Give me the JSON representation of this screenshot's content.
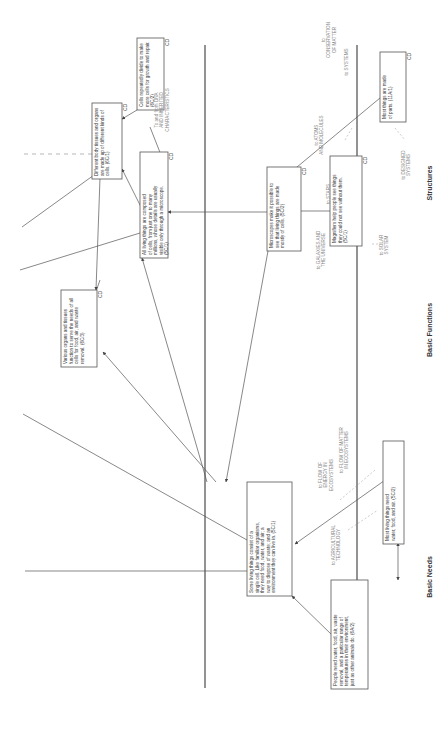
{
  "bands": [
    {
      "label": "Structures"
    },
    {
      "label": "Basic Functions"
    },
    {
      "label": "Basic Needs"
    }
  ],
  "nodes": [
    {
      "id": "n1",
      "code": "CD",
      "lines": [
        "Different body tissues and organs",
        "are made up of different kinds of",
        "cells. (6C/1)"
      ]
    },
    {
      "id": "n2",
      "code": "CD",
      "lines": [
        "Cells repeatedly divide to make",
        "more cells for growth and repair.",
        "(6C/2)"
      ]
    },
    {
      "id": "n3",
      "code": "CD",
      "lines": [
        "All living things are composed",
        "of cells, from just one to many",
        "millions, whose details are usually",
        "visible only through a microscope.",
        "(5C/1)"
      ]
    },
    {
      "id": "n4",
      "code": "CD",
      "lines": [
        "Microscopes make it possible to",
        "see that living things are made",
        "mostly of cells. (5C/2)"
      ]
    },
    {
      "id": "n5",
      "code": "CD",
      "lines": [
        "Magnifiers help people see things",
        "they could not see without them.",
        "(5C/1)"
      ]
    },
    {
      "id": "n6",
      "code": "CD",
      "lines": [
        "Most things are made",
        "of parts. (11A/1)"
      ]
    },
    {
      "id": "n7",
      "code": "CD",
      "lines": [
        "Various organs and tissues",
        "function to serve the needs of all",
        "cells for food, air, and waste",
        "removal. (6C/3)"
      ]
    },
    {
      "id": "n8",
      "code": "",
      "lines": [
        "Some living things consist of a",
        "single cell. Like familiar organisms,",
        "they need food, water, and air; a",
        "way to dispose of waste; and an",
        "environment they can live in. (5C/1)"
      ]
    },
    {
      "id": "n9",
      "code": "",
      "lines": [
        "Most living things need",
        "water, food, and air. (5C/2)"
      ]
    },
    {
      "id": "n10",
      "code": "",
      "lines": [
        "People need water, food, air, waste",
        "removal, and a particular range of",
        "temperatures in their environment,",
        "just as other animals do. (6A/2)"
      ]
    }
  ],
  "connections": [
    {
      "id": "c1",
      "lines": [
        "To and from DNA",
        "AND INHERITED",
        "CHARACTERISTICS"
      ]
    },
    {
      "id": "c2",
      "lines": [
        "to",
        "CONSERVATION",
        "OF MATTER"
      ]
    },
    {
      "id": "c3",
      "lines": [
        "to SYSTEMS"
      ]
    },
    {
      "id": "c4",
      "lines": [
        "to ATOMS",
        "AND MOLECULES"
      ]
    },
    {
      "id": "c5",
      "lines": [
        "to STARS"
      ]
    },
    {
      "id": "c6",
      "lines": [
        "to DESIGNED",
        "SYSTEMS"
      ]
    },
    {
      "id": "c7",
      "lines": [
        "to GALAXIES AND",
        "THE UNIVERSE"
      ]
    },
    {
      "id": "c8",
      "lines": [
        "to SOLAR",
        "SYSTEM"
      ]
    },
    {
      "id": "c9",
      "lines": [
        "to FLOW OF MATTER",
        "IN ECOSYSTEMS"
      ]
    },
    {
      "id": "c10",
      "lines": [
        "to FLOW OF",
        "ENERGY IN",
        "ECOSYSTEMS"
      ]
    },
    {
      "id": "c11",
      "lines": [
        "to AGRICULTURAL",
        "TECHNOLOGY"
      ]
    }
  ]
}
